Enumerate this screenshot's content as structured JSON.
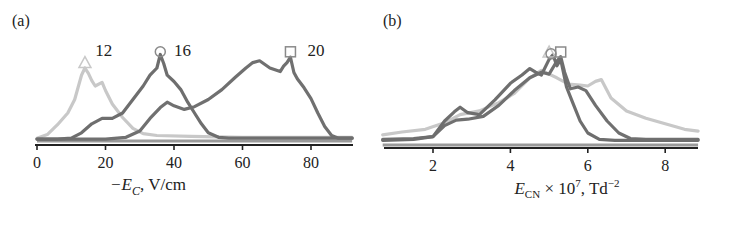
{
  "chart_data": [
    {
      "type": "line",
      "panel_label": "(a)",
      "title": "",
      "xlabel_parts": {
        "prefix": "−E",
        "subscript": "C",
        "suffix": ", V/cm"
      },
      "xlabel": "−E_C, V/cm",
      "ylabel": "",
      "xlim": [
        0,
        92
      ],
      "ylim": [
        0,
        1
      ],
      "x_ticks": [
        0,
        20,
        40,
        60,
        80
      ],
      "x_tick_labels": [
        "0",
        "20",
        "40",
        "60",
        "80"
      ],
      "grid": false,
      "series": [
        {
          "name": "12",
          "marker": "triangle",
          "color": "#c8c8c8",
          "label_at": [
            17,
            1.0
          ],
          "marker_at": [
            14,
            0.86
          ],
          "x": [
            0,
            3,
            6,
            9,
            11,
            13,
            14,
            15,
            16,
            17,
            19,
            20,
            22,
            25,
            28,
            31,
            35,
            45,
            60,
            75,
            92
          ],
          "values": [
            0.02,
            0.06,
            0.17,
            0.3,
            0.45,
            0.72,
            0.8,
            0.74,
            0.66,
            0.6,
            0.64,
            0.55,
            0.4,
            0.25,
            0.13,
            0.07,
            0.05,
            0.04,
            0.03,
            0.03,
            0.03
          ]
        },
        {
          "name": "16",
          "marker": "circle",
          "color": "#6e6e6e",
          "label_at": [
            40,
            1.0
          ],
          "marker_at": [
            36,
            0.98
          ],
          "x": [
            0,
            6,
            10,
            13,
            16,
            19,
            22,
            25,
            28,
            31,
            33,
            35,
            36,
            37,
            38,
            40,
            42,
            44,
            46,
            48,
            50,
            53,
            56,
            60,
            70,
            92
          ],
          "values": [
            0.01,
            0.01,
            0.02,
            0.08,
            0.18,
            0.24,
            0.24,
            0.3,
            0.45,
            0.6,
            0.72,
            0.8,
            0.95,
            0.85,
            0.72,
            0.65,
            0.56,
            0.42,
            0.3,
            0.18,
            0.08,
            0.03,
            0.02,
            0.02,
            0.02,
            0.02
          ]
        },
        {
          "name": "20",
          "marker": "square",
          "color": "#707070",
          "label_at": [
            79,
            1.0
          ],
          "marker_at": [
            74,
            0.98
          ],
          "x": [
            0,
            20,
            26,
            30,
            33,
            36,
            38,
            40,
            43,
            46,
            50,
            54,
            58,
            61,
            63,
            65,
            68,
            71,
            72,
            73,
            74,
            75,
            76,
            78,
            80,
            82,
            84,
            86,
            88,
            92
          ],
          "values": [
            0.01,
            0.01,
            0.03,
            0.1,
            0.24,
            0.36,
            0.42,
            0.38,
            0.34,
            0.37,
            0.45,
            0.56,
            0.7,
            0.8,
            0.86,
            0.88,
            0.8,
            0.76,
            0.82,
            0.86,
            0.92,
            0.75,
            0.68,
            0.58,
            0.46,
            0.3,
            0.15,
            0.05,
            0.02,
            0.02
          ]
        }
      ]
    },
    {
      "type": "line",
      "panel_label": "(b)",
      "title": "",
      "xlabel_parts": {
        "prefix": "E",
        "subscript": "CN",
        "middle": " × 10",
        "superscript": "7",
        "suffix": ", Td",
        "superscript2": "−2"
      },
      "xlabel": "E_CN × 10^7, Td^−2",
      "ylabel": "",
      "xlim": [
        0.7,
        8.85
      ],
      "ylim": [
        0,
        1
      ],
      "x_ticks": [
        2,
        4,
        6,
        8
      ],
      "x_tick_labels": [
        "2",
        "4",
        "6",
        "8"
      ],
      "grid": false,
      "series": [
        {
          "name": "12",
          "marker": "triangle",
          "color": "#c8c8c8",
          "marker_at": [
            5.0,
            1.0
          ],
          "x": [
            0.7,
            1.2,
            1.8,
            2.3,
            2.7,
            3.2,
            3.7,
            4.1,
            4.5,
            4.8,
            5.0,
            5.2,
            5.5,
            5.8,
            6.0,
            6.2,
            6.35,
            6.6,
            7.0,
            7.5,
            8.0,
            8.5,
            8.85
          ],
          "values": [
            0.1,
            0.13,
            0.16,
            0.23,
            0.32,
            0.36,
            0.45,
            0.55,
            0.72,
            0.8,
            0.76,
            0.72,
            0.65,
            0.64,
            0.63,
            0.68,
            0.7,
            0.5,
            0.36,
            0.28,
            0.22,
            0.16,
            0.14
          ]
        },
        {
          "name": "16",
          "marker": "circle",
          "color": "#6e6e6e",
          "marker_at": [
            5.05,
            0.98
          ],
          "x": [
            0.7,
            1.5,
            2.0,
            2.3,
            2.55,
            2.7,
            2.9,
            3.2,
            3.6,
            4.0,
            4.3,
            4.5,
            4.65,
            4.8,
            5.0,
            5.1,
            5.2,
            5.3,
            5.45,
            5.6,
            5.8,
            6.0,
            6.3,
            6.7,
            7.2,
            8.0,
            8.85
          ],
          "values": [
            0.04,
            0.05,
            0.08,
            0.25,
            0.35,
            0.4,
            0.34,
            0.32,
            0.48,
            0.66,
            0.75,
            0.82,
            0.78,
            0.75,
            0.92,
            0.97,
            0.85,
            0.92,
            0.62,
            0.46,
            0.25,
            0.12,
            0.05,
            0.04,
            0.04,
            0.04,
            0.04
          ]
        },
        {
          "name": "20",
          "marker": "square",
          "color": "#707070",
          "marker_at": [
            5.3,
            1.0
          ],
          "x": [
            0.7,
            1.5,
            2.0,
            2.3,
            2.6,
            2.9,
            3.3,
            3.7,
            4.1,
            4.5,
            4.8,
            5.0,
            5.2,
            5.3,
            5.4,
            5.55,
            5.75,
            5.95,
            6.2,
            6.5,
            6.8,
            7.1,
            7.5,
            8.0,
            8.85
          ],
          "values": [
            0.05,
            0.06,
            0.08,
            0.2,
            0.26,
            0.27,
            0.3,
            0.42,
            0.58,
            0.72,
            0.78,
            0.76,
            0.9,
            0.95,
            0.78,
            0.6,
            0.62,
            0.58,
            0.42,
            0.25,
            0.12,
            0.06,
            0.05,
            0.05,
            0.05
          ]
        }
      ]
    }
  ]
}
